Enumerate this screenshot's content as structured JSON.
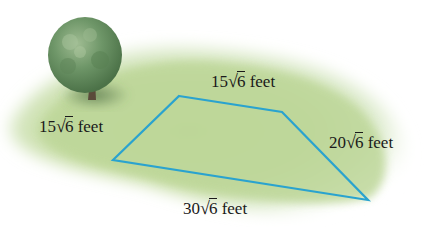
{
  "diagram": {
    "type": "quadrilateral-lot",
    "shape_color": "#2aa3cf",
    "ground_color": "#b9d48d",
    "tree_color": "#5f8a5a",
    "vertices": [
      {
        "name": "top-left",
        "x": 179,
        "y": 96
      },
      {
        "name": "top-right",
        "x": 282,
        "y": 112
      },
      {
        "name": "bottom-right",
        "x": 368,
        "y": 200
      },
      {
        "name": "bottom-left",
        "x": 113,
        "y": 160
      }
    ],
    "sides": {
      "top": {
        "coef": "15",
        "radicand": "6",
        "unit": "feet"
      },
      "left": {
        "coef": "15",
        "radicand": "6",
        "unit": "feet"
      },
      "right": {
        "coef": "20",
        "radicand": "6",
        "unit": "feet"
      },
      "bottom": {
        "coef": "30",
        "radicand": "6",
        "unit": "feet"
      }
    },
    "radical_symbol": "√"
  }
}
